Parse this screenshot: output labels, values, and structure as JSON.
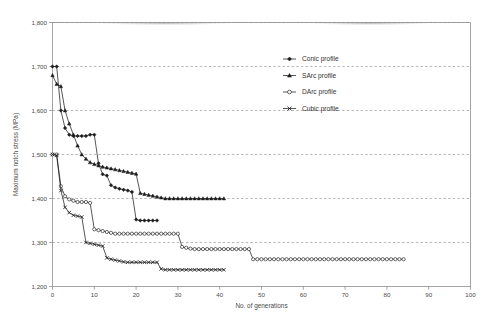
{
  "chart_data": {
    "type": "line",
    "title": "",
    "xlabel": "No. of generations",
    "ylabel": "Maximum notch stress (MPa)",
    "xlim": [
      0,
      100
    ],
    "ylim": [
      1200,
      1800
    ],
    "xticks": [
      "0",
      "10",
      "20",
      "30",
      "40",
      "50",
      "60",
      "70",
      "80",
      "90",
      "100"
    ],
    "xtick_values": [
      0,
      10,
      20,
      30,
      40,
      50,
      60,
      70,
      80,
      90,
      100
    ],
    "yticks": [
      "1,200",
      "1,300",
      "1,400",
      "1,500",
      "1,600",
      "1,700",
      "1,800"
    ],
    "ytick_values": [
      1200,
      1300,
      1400,
      1500,
      1600,
      1700,
      1800
    ],
    "grid": "horizontal-dashed",
    "legend_position": "upper-right-inside",
    "series": [
      {
        "name": "Conic profile",
        "marker": "diamond",
        "color": "#1d1d1d",
        "points": [
          [
            0,
            1700
          ],
          [
            1,
            1700
          ],
          [
            2,
            1600
          ],
          [
            3,
            1560
          ],
          [
            4,
            1545
          ],
          [
            5,
            1542
          ],
          [
            6,
            1542
          ],
          [
            7,
            1542
          ],
          [
            8,
            1542
          ],
          [
            9,
            1545
          ],
          [
            10,
            1545
          ],
          [
            11,
            1480
          ],
          [
            12,
            1455
          ],
          [
            13,
            1452
          ],
          [
            14,
            1430
          ],
          [
            15,
            1425
          ],
          [
            16,
            1422
          ],
          [
            17,
            1420
          ],
          [
            18,
            1418
          ],
          [
            19,
            1415
          ],
          [
            20,
            1352
          ],
          [
            21,
            1350
          ],
          [
            22,
            1350
          ],
          [
            23,
            1350
          ],
          [
            24,
            1350
          ],
          [
            25,
            1350
          ]
        ]
      },
      {
        "name": "SArc profile",
        "marker": "triangle",
        "color": "#1d1d1d",
        "points": [
          [
            0,
            1680
          ],
          [
            1,
            1660
          ],
          [
            2,
            1655
          ],
          [
            3,
            1600
          ],
          [
            4,
            1570
          ],
          [
            5,
            1545
          ],
          [
            6,
            1520
          ],
          [
            7,
            1500
          ],
          [
            8,
            1490
          ],
          [
            9,
            1482
          ],
          [
            10,
            1478
          ],
          [
            11,
            1475
          ],
          [
            12,
            1472
          ],
          [
            13,
            1470
          ],
          [
            14,
            1468
          ],
          [
            15,
            1466
          ],
          [
            16,
            1464
          ],
          [
            17,
            1462
          ],
          [
            18,
            1460
          ],
          [
            19,
            1458
          ],
          [
            20,
            1456
          ],
          [
            21,
            1412
          ],
          [
            22,
            1410
          ],
          [
            23,
            1408
          ],
          [
            24,
            1406
          ],
          [
            25,
            1404
          ],
          [
            26,
            1402
          ],
          [
            27,
            1400
          ],
          [
            28,
            1400
          ],
          [
            29,
            1400
          ],
          [
            30,
            1400
          ],
          [
            31,
            1400
          ],
          [
            32,
            1400
          ],
          [
            33,
            1400
          ],
          [
            34,
            1400
          ],
          [
            35,
            1400
          ],
          [
            36,
            1400
          ],
          [
            37,
            1400
          ],
          [
            38,
            1400
          ],
          [
            39,
            1400
          ],
          [
            40,
            1400
          ],
          [
            41,
            1400
          ]
        ]
      },
      {
        "name": "DArc profile",
        "marker": "circle-open",
        "color": "#1d1d1d",
        "points": [
          [
            0,
            1500
          ],
          [
            1,
            1500
          ],
          [
            2,
            1428
          ],
          [
            3,
            1405
          ],
          [
            4,
            1398
          ],
          [
            5,
            1395
          ],
          [
            6,
            1392
          ],
          [
            7,
            1392
          ],
          [
            8,
            1392
          ],
          [
            9,
            1390
          ],
          [
            10,
            1330
          ],
          [
            11,
            1328
          ],
          [
            12,
            1326
          ],
          [
            13,
            1324
          ],
          [
            14,
            1322
          ],
          [
            15,
            1320
          ],
          [
            16,
            1320
          ],
          [
            17,
            1320
          ],
          [
            18,
            1320
          ],
          [
            19,
            1320
          ],
          [
            20,
            1320
          ],
          [
            21,
            1320
          ],
          [
            22,
            1320
          ],
          [
            23,
            1320
          ],
          [
            24,
            1320
          ],
          [
            25,
            1320
          ],
          [
            26,
            1320
          ],
          [
            27,
            1320
          ],
          [
            28,
            1320
          ],
          [
            29,
            1320
          ],
          [
            30,
            1320
          ],
          [
            31,
            1290
          ],
          [
            32,
            1288
          ],
          [
            33,
            1286
          ],
          [
            34,
            1285
          ],
          [
            35,
            1285
          ],
          [
            36,
            1285
          ],
          [
            37,
            1285
          ],
          [
            38,
            1285
          ],
          [
            39,
            1285
          ],
          [
            40,
            1285
          ],
          [
            41,
            1285
          ],
          [
            42,
            1285
          ],
          [
            43,
            1285
          ],
          [
            44,
            1285
          ],
          [
            45,
            1285
          ],
          [
            46,
            1285
          ],
          [
            47,
            1285
          ],
          [
            48,
            1262
          ],
          [
            49,
            1262
          ],
          [
            50,
            1262
          ],
          [
            51,
            1262
          ],
          [
            52,
            1262
          ],
          [
            53,
            1262
          ],
          [
            54,
            1262
          ],
          [
            55,
            1262
          ],
          [
            56,
            1262
          ],
          [
            57,
            1262
          ],
          [
            58,
            1262
          ],
          [
            59,
            1262
          ],
          [
            60,
            1262
          ],
          [
            61,
            1262
          ],
          [
            62,
            1262
          ],
          [
            63,
            1262
          ],
          [
            64,
            1262
          ],
          [
            65,
            1262
          ],
          [
            66,
            1262
          ],
          [
            67,
            1262
          ],
          [
            68,
            1262
          ],
          [
            69,
            1262
          ],
          [
            70,
            1262
          ],
          [
            71,
            1262
          ],
          [
            72,
            1262
          ],
          [
            73,
            1262
          ],
          [
            74,
            1262
          ],
          [
            75,
            1262
          ],
          [
            76,
            1262
          ],
          [
            77,
            1262
          ],
          [
            78,
            1262
          ],
          [
            79,
            1262
          ],
          [
            80,
            1262
          ],
          [
            81,
            1262
          ],
          [
            82,
            1262
          ],
          [
            83,
            1262
          ],
          [
            84,
            1262
          ]
        ]
      },
      {
        "name": "Cubic profile",
        "marker": "cross",
        "color": "#1d1d1d",
        "points": [
          [
            0,
            1500
          ],
          [
            1,
            1498
          ],
          [
            2,
            1418
          ],
          [
            3,
            1380
          ],
          [
            4,
            1368
          ],
          [
            5,
            1362
          ],
          [
            6,
            1360
          ],
          [
            7,
            1358
          ],
          [
            8,
            1300
          ],
          [
            9,
            1298
          ],
          [
            10,
            1296
          ],
          [
            11,
            1294
          ],
          [
            12,
            1292
          ],
          [
            13,
            1265
          ],
          [
            14,
            1262
          ],
          [
            15,
            1260
          ],
          [
            16,
            1258
          ],
          [
            17,
            1256
          ],
          [
            18,
            1255
          ],
          [
            19,
            1255
          ],
          [
            20,
            1255
          ],
          [
            21,
            1255
          ],
          [
            22,
            1255
          ],
          [
            23,
            1255
          ],
          [
            24,
            1255
          ],
          [
            25,
            1255
          ],
          [
            26,
            1240
          ],
          [
            27,
            1238
          ],
          [
            28,
            1238
          ],
          [
            29,
            1238
          ],
          [
            30,
            1238
          ],
          [
            31,
            1238
          ],
          [
            32,
            1238
          ],
          [
            33,
            1238
          ],
          [
            34,
            1238
          ],
          [
            35,
            1238
          ],
          [
            36,
            1238
          ],
          [
            37,
            1238
          ],
          [
            38,
            1238
          ],
          [
            39,
            1238
          ],
          [
            40,
            1238
          ],
          [
            41,
            1238
          ]
        ]
      }
    ]
  },
  "legend": {
    "items": [
      {
        "label": "Conic profile",
        "marker": "diamond"
      },
      {
        "label": "SArc profile",
        "marker": "triangle"
      },
      {
        "label": "DArc profile",
        "marker": "circle-open"
      },
      {
        "label": "Cubic profile",
        "marker": "cross"
      }
    ]
  }
}
